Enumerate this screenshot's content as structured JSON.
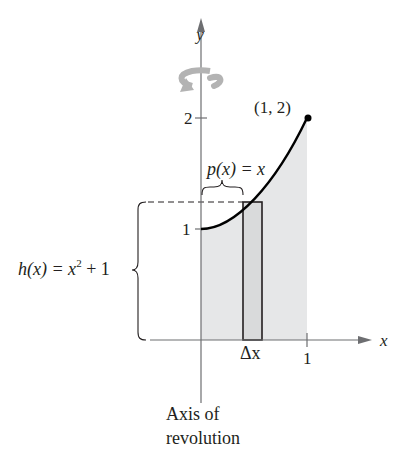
{
  "figure": {
    "axes": {
      "x_label": "x",
      "y_label": "y",
      "x_ticks": [
        {
          "value": 1,
          "label": "1"
        }
      ],
      "y_ticks": [
        {
          "value": 1,
          "label": "1"
        },
        {
          "value": 2,
          "label": "2"
        }
      ]
    },
    "curve": {
      "function": "x^2 + 1",
      "domain": [
        0,
        1
      ],
      "endpoint_label": "(1, 2)"
    },
    "annotations": {
      "p_label_prefix": "p(x) = x",
      "h_label_prefix": "h(x) = x",
      "h_label_exp": "2",
      "h_label_suffix": " + 1",
      "delta_x_label": "Δx",
      "axis_of_revolution_line1": "Axis of",
      "axis_of_revolution_line2": "revolution"
    },
    "icons": {
      "rotation": "rotation-arrow-icon"
    },
    "colors": {
      "axis": "#6d6e71",
      "curve": "#000000",
      "shade": "#e6e7e8",
      "rotation_arrow": "#b3b3b3",
      "text": "#231f20"
    }
  }
}
